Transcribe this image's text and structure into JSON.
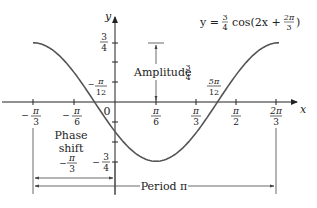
{
  "chart_data": {
    "type": "line",
    "equation": {
      "lhs": "y =",
      "coef_num": "3",
      "coef_den": "4",
      "func": "cos(2x +",
      "shift_num": "2π",
      "shift_den": "3",
      "close": ")"
    },
    "xlabel": "x",
    "ylabel": "y",
    "x_range": [
      -0.5236,
      2.0944
    ],
    "y_range": [
      -0.75,
      0.75
    ],
    "x_ticks": [
      {
        "value": -1.0472,
        "num": "π",
        "den": "3",
        "neg": true
      },
      {
        "value": -0.5236,
        "num": "π",
        "den": "6",
        "neg": true
      },
      {
        "value": 0.5236,
        "num": "π",
        "den": "6",
        "neg": false
      },
      {
        "value": 1.0472,
        "num": "π",
        "den": "3",
        "neg": false
      },
      {
        "value": 1.5708,
        "num": "π",
        "den": "2",
        "neg": false
      },
      {
        "value": 2.0944,
        "num": "2π",
        "den": "3",
        "neg": false
      }
    ],
    "y_ticks": [
      {
        "value": 0.75,
        "num": "3",
        "den": "4",
        "neg": false
      },
      {
        "value": -0.75,
        "num": "3",
        "den": "4",
        "neg": true
      }
    ],
    "origin_label": "0",
    "zeros": [
      {
        "value": -0.2618,
        "num": "π",
        "den": "12",
        "neg": true
      },
      {
        "value": 1.309,
        "num": "5π",
        "den": "12",
        "neg": false
      }
    ],
    "annotations": {
      "amplitude": {
        "label": "Amplitude",
        "num": "3",
        "den": "4"
      },
      "phase_shift": {
        "line1": "Phase",
        "line2": "shift",
        "num": "π",
        "den": "3",
        "neg": true
      },
      "period": {
        "label": "Period π"
      }
    },
    "series": [
      {
        "name": "y = 3/4 cos(2x + 2π/3)",
        "amplitude": 0.75,
        "b": 2,
        "c": 2.0944,
        "x": [
          -1.0472,
          -0.7854,
          -0.5236,
          -0.2618,
          0,
          0.2618,
          0.5236,
          0.7854,
          1.0472,
          1.309,
          1.5708,
          1.8326,
          2.0944
        ],
        "y": [
          0.75,
          0.6495,
          0.375,
          0,
          -0.375,
          -0.6495,
          -0.75,
          -0.6495,
          -0.375,
          0,
          0.375,
          0.6495,
          0.75
        ]
      }
    ],
    "grid": false,
    "legend": "none"
  }
}
